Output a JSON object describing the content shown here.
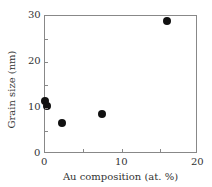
{
  "chart_data": {
    "type": "scatter",
    "title": "",
    "xlabel": "Au composition (at. %)",
    "ylabel": "Grain size (nm)",
    "xlim": [
      0,
      20
    ],
    "ylim": [
      0,
      30
    ],
    "xticks": [
      "0",
      "10",
      "20"
    ],
    "yticks": [
      "0",
      "10",
      "20",
      "30"
    ],
    "grid": false,
    "legend": null,
    "series": [
      {
        "name": "Grain size",
        "x": [
          0.0,
          0.3,
          2.2,
          7.5,
          15.9
        ],
        "y": [
          11.5,
          10.4,
          6.7,
          8.6,
          28.9
        ]
      }
    ]
  }
}
